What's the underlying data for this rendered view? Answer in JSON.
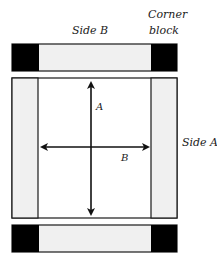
{
  "diagram": {
    "labels": {
      "side_b": "Side B",
      "corner_block_line1": "Corner",
      "corner_block_line2": "block",
      "side_a": "Side A",
      "arrow_a": "A",
      "arrow_b": "B"
    },
    "colors": {
      "corner_block": "#000000",
      "side_fill": "#f0f0f0",
      "inner_fill": "#ffffff",
      "stroke": "#1a1a1a"
    }
  }
}
